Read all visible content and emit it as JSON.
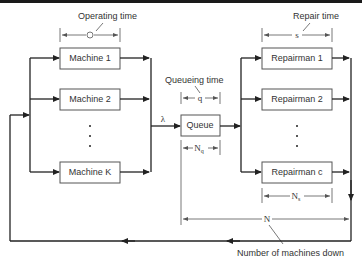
{
  "diagram": {
    "machines": {
      "boxes": [
        "Machine 1",
        "Machine 2",
        "Machine K"
      ],
      "ellipsis": "⋮"
    },
    "queue": {
      "label": "Queue"
    },
    "repairmen": {
      "boxes": [
        "Repairman 1",
        "Repairman 2",
        "Repairman c"
      ],
      "ellipsis": "⋮"
    },
    "annotations": {
      "operating_time": "Operating time",
      "operating_time_symbol": "O",
      "queueing_time": "Queueing time",
      "queueing_time_symbol": "q",
      "repair_time": "Repair time",
      "repair_time_symbol": "s",
      "arrival_rate_symbol": "λ",
      "queue_count_symbol": "N",
      "queue_count_subscript": "q",
      "service_count_symbol": "N",
      "service_count_subscript": "s",
      "total_down_symbol": "N",
      "total_down_label": "Number of machines down"
    }
  }
}
